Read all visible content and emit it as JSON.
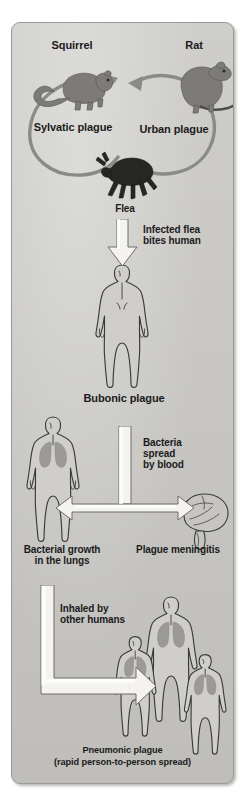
{
  "figure": {
    "panel_color": "#c9c8c4",
    "label_color": "#1b1b1b",
    "arrow_fill": "#f4f3f0",
    "loop_arrow_color": "#8a8a86",
    "animal_color": "#7c7b78",
    "flea_color": "#2a2a2a",
    "body_outline": "#3a3a38",
    "lung_color": "#9b9a97"
  },
  "labels": {
    "squirrel": "Squirrel",
    "rat": "Rat",
    "sylvatic_plague": "Sylvatic plague",
    "urban_plague": "Urban plague",
    "flea": "Flea",
    "infected_flea_bites_human": "Infected flea\nbites human",
    "bubonic_plague": "Bubonic plague",
    "bacteria_spread_by_blood": "Bacteria\nspread\nby blood",
    "bacterial_growth_in_the_lungs": "Bacterial growth\nin the lungs",
    "plague_meningitis": "Plague meningitis",
    "inhaled_by_other_humans": "Inhaled by\nother humans",
    "pneumonic_plague": "Pneumonic plague\n(rapid person-to-person spread)"
  },
  "nodes": [
    {
      "id": "squirrel",
      "label": "Squirrel",
      "icon": "squirrel-icon"
    },
    {
      "id": "rat",
      "label": "Rat",
      "icon": "rat-icon"
    },
    {
      "id": "flea",
      "label": "Flea",
      "icon": "flea-icon"
    },
    {
      "id": "bubonic",
      "label": "Bubonic plague",
      "icon": "human-figure-icon"
    },
    {
      "id": "lungs",
      "label": "Bacterial growth in the lungs",
      "icon": "human-figure-lungs-icon"
    },
    {
      "id": "meningitis",
      "label": "Plague meningitis",
      "icon": "brain-icon"
    },
    {
      "id": "pneumonic",
      "label": "Pneumonic plague (rapid person-to-person spread)",
      "icon": "three-human-figures-icon"
    }
  ],
  "edges": [
    {
      "from": "flea",
      "to": "squirrel",
      "label": "Sylvatic plague",
      "style": "curved-loop"
    },
    {
      "from": "flea",
      "to": "rat",
      "label": "Urban plague",
      "style": "curved-loop"
    },
    {
      "from": "flea",
      "to": "bubonic",
      "label": "Infected flea bites human",
      "style": "block-arrow-down"
    },
    {
      "from": "bubonic",
      "to": "lungs",
      "label": "Bacteria spread by blood",
      "style": "block-arrow-t-left"
    },
    {
      "from": "bubonic",
      "to": "meningitis",
      "label": "Bacteria spread by blood",
      "style": "block-arrow-t-right"
    },
    {
      "from": "lungs",
      "to": "pneumonic",
      "label": "Inhaled by other humans",
      "style": "block-arrow-elbow"
    }
  ]
}
